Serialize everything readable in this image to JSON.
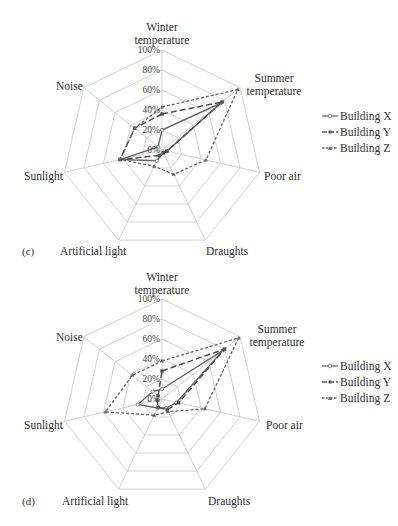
{
  "chart_data": [
    {
      "type": "radar",
      "panel_label": "(c)",
      "axes": [
        "Winter temperature",
        "Summer temperature",
        "Poor air",
        "Draughts",
        "Artificial light",
        "Sunlight",
        "Noise"
      ],
      "tick_labels": [
        "0%",
        "20%",
        "40%",
        "60%",
        "80%",
        "100%"
      ],
      "range": [
        0,
        100
      ],
      "series": [
        {
          "name": "Building X",
          "style": "solid",
          "marker": "circle",
          "values": [
            20,
            75,
            5,
            3,
            12,
            43,
            5
          ]
        },
        {
          "name": "Building Y",
          "style": "long-dash",
          "marker": "square",
          "values": [
            36,
            77,
            5,
            3,
            6,
            43,
            35
          ]
        },
        {
          "name": "Building Z",
          "style": "dashed",
          "marker": "triangle",
          "values": [
            43,
            97,
            45,
            27,
            18,
            43,
            35
          ]
        }
      ],
      "legend_position": "right"
    },
    {
      "type": "radar",
      "panel_label": "(d)",
      "axes": [
        "Winter temperature",
        "Summer temperature",
        "Poor air",
        "Draughts",
        "Artificial light",
        "Sunlight",
        "Noise"
      ],
      "tick_labels": [
        "0%",
        "20%",
        "40%",
        "60%",
        "80%",
        "100%"
      ],
      "range": [
        0,
        100
      ],
      "series": [
        {
          "name": "Building X",
          "style": "solid",
          "marker": "circle",
          "values": [
            10,
            78,
            15,
            10,
            10,
            25,
            12
          ]
        },
        {
          "name": "Building Y",
          "style": "long-dash",
          "marker": "square",
          "values": [
            28,
            80,
            17,
            12,
            9,
            5,
            5
          ]
        },
        {
          "name": "Building Z",
          "style": "dashed",
          "marker": "triangle",
          "values": [
            38,
            98,
            44,
            14,
            18,
            58,
            38
          ]
        }
      ],
      "legend_position": "right"
    }
  ],
  "panels": {
    "c": {
      "label": "(c)",
      "axis_labels": {
        "winter_1": "Winter",
        "winter_2": "temperature",
        "summer_1": "Summer",
        "summer_2": "temperature",
        "poor_air": "Poor air",
        "draughts": "Draughts",
        "artificial_light": "Artificial light",
        "sunlight": "Sunlight",
        "noise": "Noise"
      },
      "ticks": {
        "t0": "0%",
        "t20": "20%",
        "t40": "40%",
        "t60": "60%",
        "t80": "80%",
        "t100": "100%"
      },
      "legend": {
        "x": "Building X",
        "y": "Building Y",
        "z": "Building Z"
      }
    },
    "d": {
      "label": "(d)",
      "axis_labels": {
        "winter_1": "Winter",
        "winter_2": "temperature",
        "summer_1": "Summer",
        "summer_2": "temperature",
        "poor_air": "Poor air",
        "draughts": "Draughts",
        "artificial_light": "Artificial light",
        "sunlight": "Sunlight",
        "noise": "Noise"
      },
      "ticks": {
        "t0": "0%",
        "t20": "20%",
        "t40": "40%",
        "t60": "60%",
        "t80": "80%",
        "t100": "100%"
      },
      "legend": {
        "x": "Building X",
        "y": "Building Y",
        "z": "Building Z"
      }
    }
  },
  "colors": {
    "grid": "#c8c8c8",
    "series": "#5a5a5a",
    "text": "#333333"
  }
}
